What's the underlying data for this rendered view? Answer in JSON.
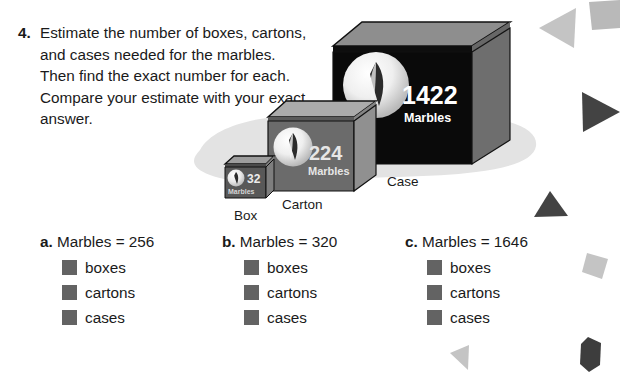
{
  "question": {
    "number": "4.",
    "text": "Estimate the number of boxes, cartons, and cases needed for the marbles. Then find the exact number for each. Compare your estimate with your exact answer."
  },
  "illustration": {
    "containers": [
      {
        "id": "box",
        "count": "32",
        "unit": "Marbles",
        "caption": "Box"
      },
      {
        "id": "carton",
        "count": "224",
        "unit": "Marbles",
        "caption": "Carton"
      },
      {
        "id": "case",
        "count": "1422",
        "unit": "Marbles",
        "caption": "Case"
      }
    ],
    "logo_name": "marble-logo-icon"
  },
  "answers": [
    {
      "letter": "a.",
      "prompt": "Marbles = 256",
      "items": [
        {
          "label": "boxes"
        },
        {
          "label": "cartons"
        },
        {
          "label": "cases"
        }
      ]
    },
    {
      "letter": "b.",
      "prompt": "Marbles = 320",
      "items": [
        {
          "label": "boxes"
        },
        {
          "label": "cartons"
        },
        {
          "label": "cases"
        }
      ]
    },
    {
      "letter": "c.",
      "prompt": "Marbles = 1646",
      "items": [
        {
          "label": "boxes"
        },
        {
          "label": "cartons"
        },
        {
          "label": "cases"
        }
      ]
    }
  ],
  "decorations": [
    {
      "name": "triangle-left-light-shape"
    },
    {
      "name": "quadrilateral-light-shape"
    },
    {
      "name": "triangle-right-dark-shape"
    },
    {
      "name": "triangle-up-dark-shape"
    },
    {
      "name": "square-light-shape"
    },
    {
      "name": "hexagon-dark-shape"
    },
    {
      "name": "triangle-left-small-shape"
    }
  ],
  "colors": {
    "text": "#1a1a1a",
    "blank_fill": "#636363",
    "case_front": "#0a0a0a",
    "case_side": "#6e6e6e",
    "case_top": "#8c8c8c",
    "carton_front": "#6b6b6b",
    "carton_side": "#8f8f8f",
    "carton_top": "#a8a8a8",
    "box_front": "#555555",
    "shadow": "#e0e0e0",
    "decor_light": "#c9c9c9",
    "decor_dark": "#4a4a4a"
  }
}
